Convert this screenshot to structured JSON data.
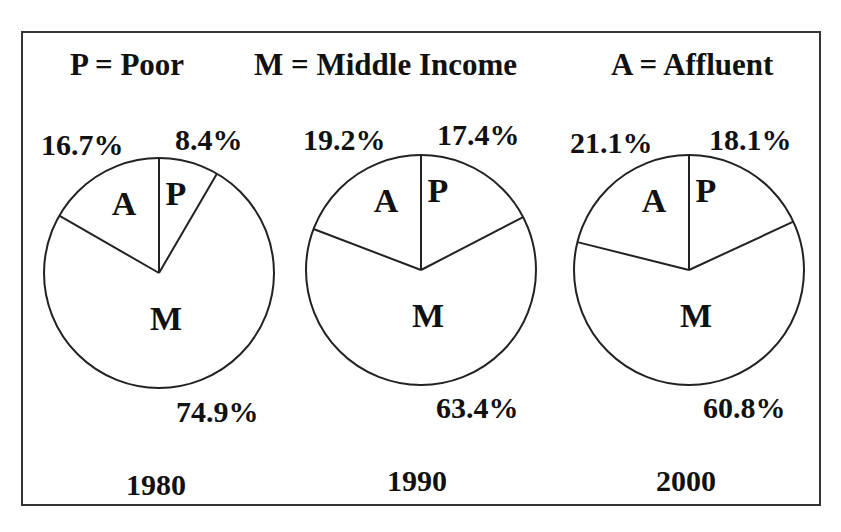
{
  "legend": {
    "poor": "P = Poor",
    "middle": "M = Middle Income",
    "affluent": "A = Affluent"
  },
  "pies": [
    {
      "year": "1980",
      "cx": 159,
      "cy": 273,
      "r": 115,
      "labels": {
        "A": "A",
        "P": "P",
        "M": "M"
      },
      "pct": {
        "affluent": "16.7%",
        "poor": "8.4%",
        "middle": "74.9%"
      },
      "values": {
        "poor": 8.4,
        "middle": 74.9,
        "affluent": 16.7
      }
    },
    {
      "year": "1990",
      "cx": 421,
      "cy": 270,
      "r": 115,
      "labels": {
        "A": "A",
        "P": "P",
        "M": "M"
      },
      "pct": {
        "affluent": "19.2%",
        "poor": "17.4%",
        "middle": "63.4%"
      },
      "values": {
        "poor": 17.4,
        "middle": 63.4,
        "affluent": 19.2
      }
    },
    {
      "year": "2000",
      "cx": 689,
      "cy": 270,
      "r": 115,
      "labels": {
        "A": "A",
        "P": "P",
        "M": "M"
      },
      "pct": {
        "affluent": "21.1%",
        "poor": "18.1%",
        "middle": "60.8%"
      },
      "values": {
        "poor": 18.1,
        "middle": 60.8,
        "affluent": 21.1
      }
    }
  ],
  "chart_data": {
    "type": "pie",
    "title": "",
    "legend": [
      "P = Poor",
      "M = Middle Income",
      "A = Affluent"
    ],
    "categories": [
      "Poor",
      "Middle Income",
      "Affluent"
    ],
    "charts": [
      {
        "label": "1980",
        "values": [
          8.4,
          74.9,
          16.7
        ]
      },
      {
        "label": "1990",
        "values": [
          17.4,
          63.4,
          19.2
        ]
      },
      {
        "label": "2000",
        "values": [
          18.1,
          60.8,
          21.1
        ]
      }
    ],
    "units": "%",
    "slice_order": "clockwise from 12 o'clock: P, M, A",
    "fill": "white with black outlines"
  }
}
